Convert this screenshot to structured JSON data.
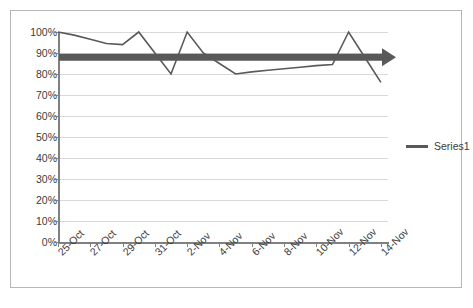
{
  "chart_data": {
    "type": "line",
    "title": "",
    "xlabel": "",
    "ylabel": "",
    "ylim": [
      0,
      1.0
    ],
    "grid": true,
    "legend_position": "right",
    "x_tick_labels": [
      "25-Oct",
      "27-Oct",
      "29-Oct",
      "31-Oct",
      "2-Nov",
      "4-Nov",
      "6-Nov",
      "8-Nov",
      "10-Nov",
      "12-Nov",
      "14-Nov"
    ],
    "y_tick_labels": [
      "100%",
      "90%",
      "80%",
      "70%",
      "60%",
      "50%",
      "40%",
      "30%",
      "20%",
      "10%",
      "0%"
    ],
    "y_tick_values": [
      1.0,
      0.9,
      0.8,
      0.7,
      0.6,
      0.5,
      0.4,
      0.3,
      0.2,
      0.1,
      0.0
    ],
    "series": [
      {
        "name": "Series1",
        "color": "#595959",
        "x": [
          "25-Oct",
          "26-Oct",
          "27-Oct",
          "28-Oct",
          "29-Oct",
          "30-Oct",
          "31-Oct",
          "1-Nov",
          "2-Nov",
          "3-Nov",
          "4-Nov",
          "5-Nov",
          "6-Nov",
          "7-Nov",
          "8-Nov",
          "9-Nov",
          "10-Nov",
          "11-Nov",
          "12-Nov",
          "13-Nov",
          "14-Nov"
        ],
        "values": [
          1.0,
          0.985,
          0.965,
          0.945,
          0.94,
          1.0,
          0.9,
          0.8,
          1.0,
          0.9,
          0.85,
          0.8,
          0.81,
          0.818,
          0.825,
          0.832,
          0.84,
          0.845,
          1.0,
          0.88,
          0.76
        ]
      }
    ],
    "annotations": [
      {
        "name": "target-arrow",
        "type": "arrow",
        "value": 0.88,
        "color": "#595959",
        "direction": "right",
        "from_x": "25-Oct",
        "to_x": "14-Nov"
      }
    ]
  },
  "legend": {
    "entries": [
      {
        "label": "Series1"
      }
    ]
  }
}
